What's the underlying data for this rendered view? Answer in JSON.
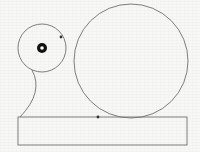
{
  "diagram": {
    "stroke_color": "#707070",
    "point_color": "#333333",
    "hub_color": "#111111",
    "background": "#f7f7f5",
    "small_circle": {
      "cx": 42,
      "cy": 48,
      "r": 24
    },
    "large_circle": {
      "cx": 131,
      "cy": 61,
      "r": 57
    },
    "hub": {
      "cx": 42,
      "cy": 48,
      "outer_r": 5,
      "inner_r": 1.8
    },
    "base": {
      "x": 18,
      "y": 117,
      "width": 169,
      "height": 28
    },
    "support_path": "M 32 70 Q 44 92 20 117",
    "contact_points": [
      {
        "name": "circle-circle-contact",
        "x": 61,
        "y": 37,
        "label": ""
      },
      {
        "name": "circle-base-contact",
        "x": 98,
        "y": 117,
        "label": ""
      }
    ]
  }
}
